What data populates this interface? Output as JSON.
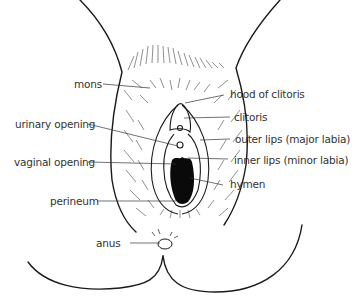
{
  "diagram": {
    "labels": {
      "mons": "mons",
      "urinary_opening": "urinary opening",
      "vaginal_opening": "vaginal opening",
      "perineum": "perineum",
      "anus": "anus",
      "hood_of_clitoris": "hood of clitoris",
      "clitoris": "clitoris",
      "outer_lips": "outer lips (major labia)",
      "inner_lips": "inner lips (minor labia)",
      "hymen": "hymen"
    },
    "colors": {
      "line": "#1a1a1a",
      "text": "#333333",
      "background": "#ffffff"
    }
  }
}
